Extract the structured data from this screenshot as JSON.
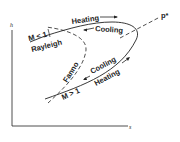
{
  "diagram": {
    "type": "h-s diagram",
    "axes": {
      "y_label": "h",
      "x_label": "s"
    },
    "curves": [
      {
        "name": "Rayleigh",
        "style": "solid"
      },
      {
        "name": "Fanno",
        "style": "dashed"
      },
      {
        "name": "p*",
        "style": "dashed"
      }
    ],
    "labels": {
      "heating_upper": "Heating",
      "cooling_upper": "Cooling",
      "subsonic": "M < 1",
      "rayleigh": "Rayleigh",
      "fanno": "Fanno",
      "cooling_lower": "Cooling",
      "heating_lower": "Heating",
      "supersonic": "M > 1",
      "pstar": "p*"
    },
    "colors": {
      "ink": "#222222",
      "background": "#ffffff"
    }
  }
}
